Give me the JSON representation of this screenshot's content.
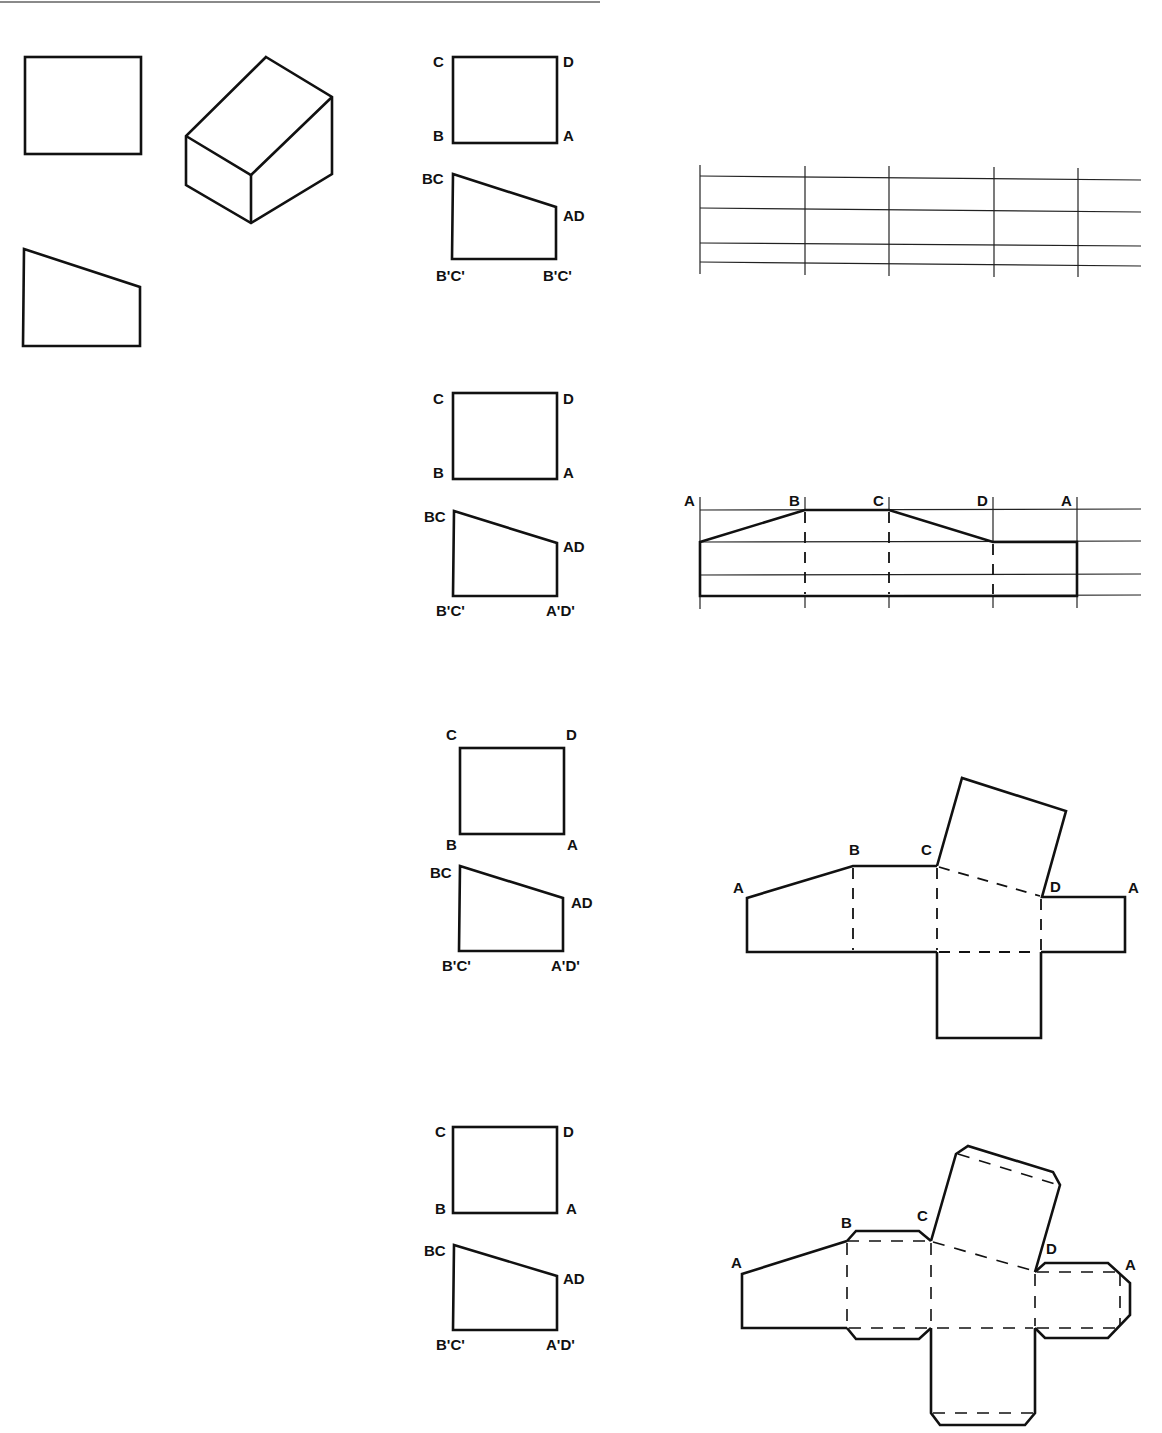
{
  "figure": {
    "orthographic_views": {
      "top_view": "rectangle",
      "isometric": "truncated block",
      "front_view": "trapezoid"
    },
    "steps": [
      {
        "name": "step-1",
        "top_view_labels": {
          "tl": "C",
          "tr": "D",
          "bl": "B",
          "br": "A"
        },
        "front_view_labels": {
          "tl": "BC",
          "tr": "AD",
          "bl": "B'C'",
          "br": "B'C'"
        },
        "stretchout_labels": []
      },
      {
        "name": "step-2",
        "top_view_labels": {
          "tl": "C",
          "tr": "D",
          "bl": "B",
          "br": "A"
        },
        "front_view_labels": {
          "tl": "BC",
          "tr": "AD",
          "bl": "B'C'",
          "br": "A'D'"
        },
        "stretchout_labels": [
          "A",
          "B",
          "C",
          "D",
          "A"
        ]
      },
      {
        "name": "step-3",
        "top_view_labels": {
          "tl": "C",
          "tr": "D",
          "bl": "B",
          "br": "A"
        },
        "front_view_labels": {
          "tl": "BC",
          "tr": "AD",
          "bl": "B'C'",
          "br": "A'D'"
        },
        "pattern_labels": {
          "a_left": "A",
          "b": "B",
          "c": "C",
          "d": "D",
          "a_right": "A"
        }
      },
      {
        "name": "step-4",
        "top_view_labels": {
          "tl": "C",
          "tr": "D",
          "bl": "B",
          "br": "A"
        },
        "front_view_labels": {
          "tl": "BC",
          "tr": "AD",
          "bl": "B'C'",
          "br": "A'D'"
        },
        "pattern_labels": {
          "a_left": "A",
          "b": "B",
          "c": "C",
          "d": "D",
          "a_right": "A"
        }
      }
    ],
    "colors": {
      "line": "#111111",
      "background": "#ffffff",
      "top_rule": "#8a8a8a"
    }
  }
}
